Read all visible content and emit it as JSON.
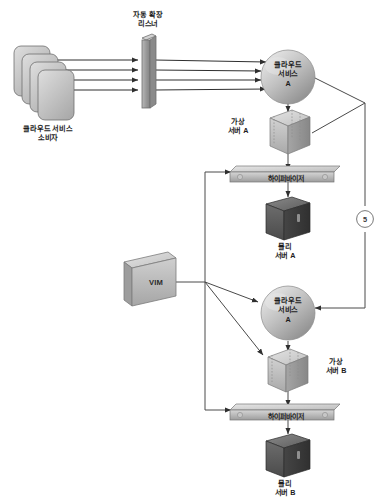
{
  "diagram": {
    "nodes": {
      "consumer": {
        "label": "클라우드 서비스\n소비자",
        "icon": "stacked-consumer-icon",
        "count": 4
      },
      "listener": {
        "label": "자동 확장\n리스너",
        "icon": "scaling-listener-bar-icon"
      },
      "cloud_service_a_top": {
        "label": "클라우드\n서비스\nA",
        "icon": "cloud-service-sphere-icon"
      },
      "virtual_server_a": {
        "label": "가상\n서버 A",
        "icon": "virtual-server-cube-icon"
      },
      "hypervisor_a": {
        "label": "하이퍼바이저",
        "icon": "hypervisor-bar-icon"
      },
      "physical_server_a": {
        "label": "물리\n서버 A",
        "icon": "physical-server-icon"
      },
      "vim": {
        "label": "VIM",
        "icon": "vim-cube-icon"
      },
      "cloud_service_a_bottom": {
        "label": "클라우드\n서비스\nA",
        "icon": "cloud-service-sphere-icon"
      },
      "virtual_server_b": {
        "label": "가상\n서버 B",
        "icon": "virtual-server-cube-icon"
      },
      "hypervisor_b": {
        "label": "하이퍼바이저",
        "icon": "hypervisor-bar-icon"
      },
      "physical_server_b": {
        "label": "물리\n서버 B",
        "icon": "physical-server-icon"
      }
    },
    "markers": [
      {
        "id": "step-5",
        "label": "5"
      }
    ],
    "colors": {
      "line": "#3b3b3b",
      "sphere_light": "#d8d8d8",
      "sphere_dark": "#9a9a9a",
      "cube_light": "#cfcfcf",
      "cube_dark": "#8f8f8f",
      "bar_light": "#c9c9c9",
      "bar_dark": "#8a8a8a",
      "physical_light": "#6e6e6e",
      "physical_dark": "#3f3f3f",
      "text": "#1c1c1c"
    }
  }
}
